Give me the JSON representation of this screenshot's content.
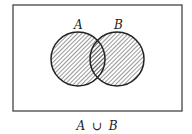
{
  "diagram": {
    "type": "venn",
    "universe": {
      "x": 13,
      "y": 5,
      "width": 169,
      "height": 106
    },
    "sets": [
      {
        "label": "A",
        "cx": 78,
        "cy": 59,
        "r": 27
      },
      {
        "label": "B",
        "cx": 117,
        "cy": 59,
        "r": 27
      }
    ],
    "shaded_region": "union",
    "caption": {
      "set_a": "A",
      "operator": "∪",
      "set_b": "B"
    }
  }
}
